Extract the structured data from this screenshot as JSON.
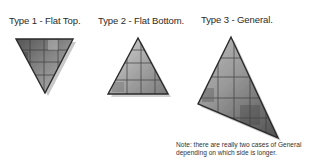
{
  "labels": {
    "type1": "Type 1 - Flat Top.",
    "type2": "Type 2 - Flat Bottom.",
    "type3": "Type 3 - General."
  },
  "note": {
    "line1": "Note: there are really two cases of General",
    "line2": "depending on which side is longer."
  },
  "triangles": [
    {
      "name": "flat-top",
      "vertices": [
        [
          16,
          39
        ],
        [
          73,
          39
        ],
        [
          45,
          93
        ]
      ]
    },
    {
      "name": "flat-bottom",
      "vertices": [
        [
          138,
          38
        ],
        [
          108,
          94
        ],
        [
          168,
          94
        ]
      ]
    },
    {
      "name": "general",
      "vertices": [
        [
          231,
          37
        ],
        [
          198,
          104
        ],
        [
          278,
          138
        ]
      ]
    }
  ],
  "colors": {
    "outline": "#2a2a2a",
    "fill_dark": "#6e6e6e",
    "fill_light": "#c9c9c9",
    "grid": "#3a3a3a",
    "shadow": "#bdbdbd"
  }
}
